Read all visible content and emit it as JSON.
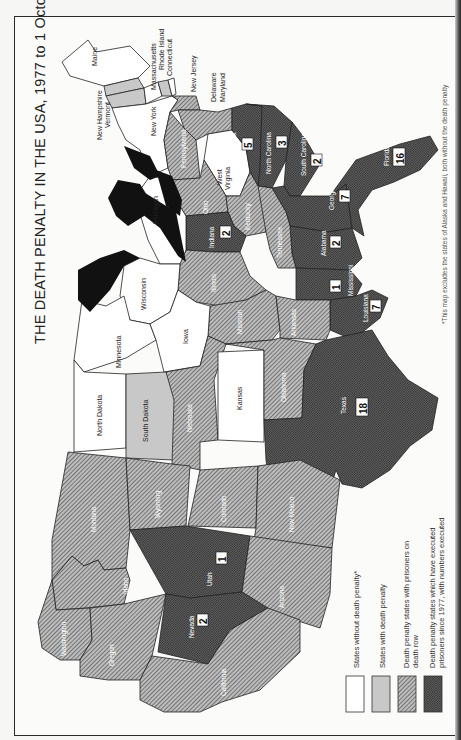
{
  "title": "THE DEATH PENALTY IN THE USA, 1977 to 1 October 1986",
  "footnote": "*This map excludes the states of Alaska and Hawaii, both without the death penalty",
  "colors": {
    "no_penalty": "#ffffff",
    "with_penalty": "#c8c8c8",
    "death_row": "#9a9a9a",
    "executed": "#5a5a5a",
    "lakes": "#111111",
    "border": "#222222"
  },
  "legend": [
    {
      "key": "no_penalty",
      "label": "States without death penalty*"
    },
    {
      "key": "with_penalty",
      "label": "States with death penalty"
    },
    {
      "key": "death_row",
      "label": "Death penalty states with prisoners on death row"
    },
    {
      "key": "executed",
      "label": "Death penalty states which have executed prisoners since 1977, with numbers executed"
    }
  ],
  "legend_lines": {
    "l1": "States without death penalty*",
    "l2": "States with death penalty",
    "l3a": "Death penalty states with prisoners on",
    "l3b": "death row",
    "l4a": "Death penalty states which have executed",
    "l4b": "prisoners since 1977, with numbers executed"
  },
  "states": {
    "no_penalty": [
      "Maine",
      "Massachusetts",
      "Rhode Island",
      "New York",
      "West Virginia",
      "Michigan",
      "Wisconsin",
      "Minnesota",
      "Iowa",
      "North Dakota",
      "Kansas"
    ],
    "with_penalty": [
      "New Hampshire",
      "Vermont",
      "Connecticut",
      "South Dakota"
    ],
    "death_row": [
      "New Jersey",
      "Delaware",
      "Maryland",
      "Pennsylvania",
      "Ohio",
      "Kentucky",
      "Tennessee",
      "Illinois",
      "Missouri",
      "Arkansas",
      "Oklahoma",
      "Nebraska",
      "Colorado",
      "New Mexico",
      "Wyoming",
      "Montana",
      "Idaho",
      "Washington",
      "Oregon",
      "California",
      "Arizona"
    ],
    "executed": [
      {
        "name": "Virginia",
        "count": 5
      },
      {
        "name": "North Carolina",
        "count": 3
      },
      {
        "name": "South Carolina",
        "count": 2
      },
      {
        "name": "Georgia",
        "count": 7
      },
      {
        "name": "Florida",
        "count": 16
      },
      {
        "name": "Alabama",
        "count": 2
      },
      {
        "name": "Mississippi",
        "count": 1
      },
      {
        "name": "Louisiana",
        "count": 7
      },
      {
        "name": "Indiana",
        "count": 2
      },
      {
        "name": "Texas",
        "count": 18
      },
      {
        "name": "Utah",
        "count": 1
      },
      {
        "name": "Nevada",
        "count": 2
      }
    ]
  },
  "labels": {
    "maine": "Maine",
    "new_hampshire": "New Hampshire",
    "vermont": "Vermont",
    "massachusetts": "Massachusetts",
    "rhode_island": "Rhode Island",
    "connecticut": "Connecticut",
    "new_jersey": "New Jersey",
    "delaware": "Delaware",
    "maryland": "Maryland",
    "new_york": "New York",
    "pennsylvania": "Pennsylvania",
    "west_virginia_1": "West",
    "west_virginia_2": "Virginia",
    "virginia": "Virginia",
    "north_carolina": "North Carolina",
    "south_carolina": "South Carolina",
    "georgia": "Georgia",
    "florida": "Florida",
    "ohio": "Ohio",
    "kentucky": "Kentucky",
    "tennessee": "Tennessee",
    "alabama": "Alabama",
    "mississippi": "Mississippi",
    "louisiana": "Louisiana",
    "michigan": "Michigan",
    "indiana": "Indiana",
    "illinois": "Illinois",
    "wisconsin": "Wisconsin",
    "missouri": "Missouri",
    "arkansas": "Arkansas",
    "minnesota": "Minnesota",
    "iowa": "Iowa",
    "north_dakota": "North Dakota",
    "south_dakota": "South Dakota",
    "nebraska": "Nebraska",
    "kansas": "Kansas",
    "oklahoma": "Oklahoma",
    "texas": "Texas",
    "montana": "Montana",
    "wyoming": "Wyoming",
    "colorado": "Colorado",
    "new_mexico": "New Mexico",
    "idaho": "Idaho",
    "utah": "Utah",
    "arizona": "Arizona",
    "washington": "Washington",
    "oregon": "Oregon",
    "nevada": "Nevada",
    "california": "California"
  },
  "counts": {
    "virginia": "5",
    "north_carolina": "3",
    "south_carolina": "2",
    "georgia": "7",
    "florida": "16",
    "alabama": "2",
    "mississippi": "1",
    "louisiana": "7",
    "indiana": "2",
    "texas": "18",
    "utah": "1",
    "nevada": "2"
  }
}
